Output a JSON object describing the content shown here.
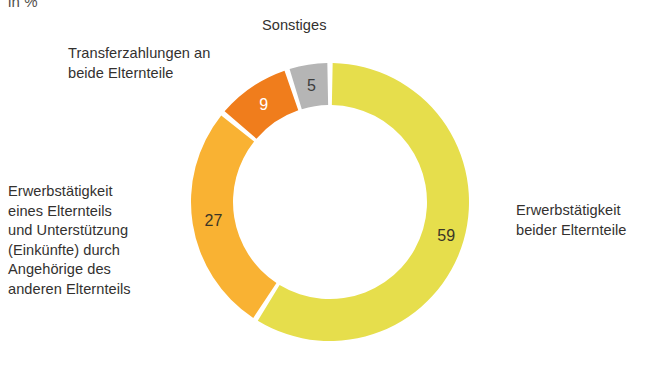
{
  "unit": {
    "text": "in %"
  },
  "labels": {
    "sonstiges": "Sonstiges",
    "transfer": "Transferzahlungen an\nbeide Elternteile",
    "erwerb_eines": "Erwerbstätigkeit\neines Elternteils\nund Unterstützung\n(Einkünfte) durch\nAngehörige des\nanderen Elternteils",
    "erwerb_beider": "Erwerbstätigkeit\nbeider Elternteile"
  },
  "values": {
    "erwerb_beider": "59",
    "erwerb_eines": "27",
    "transfer": "9",
    "sonstiges": "5"
  },
  "colors": {
    "erwerb_beider": "#e6de4c",
    "erwerb_eines": "#f9b233",
    "transfer": "#f07d1c",
    "sonstiges": "#b5b5b5",
    "separator": "#ffffff",
    "text": "#33312f"
  },
  "chart_data": {
    "type": "pie",
    "title": "",
    "subtitle": "in %",
    "xlabel": "",
    "ylabel": "",
    "unit": "%",
    "donut": true,
    "legend_position": "callout-labels",
    "grid": false,
    "start_angle_deg": 0,
    "direction": "clockwise",
    "categories": [
      "Erwerbstätigkeit beider Elternteile",
      "Erwerbstätigkeit eines Elternteils und Unterstützung (Einkünfte) durch Angehörige des anderen Elternteils",
      "Transferzahlungen an beide Elternteile",
      "Sonstiges"
    ],
    "values": [
      59,
      27,
      9,
      5
    ],
    "colors": [
      "#e6de4c",
      "#f9b233",
      "#f07d1c",
      "#b5b5b5"
    ],
    "data_labels": [
      "59",
      "27",
      "9",
      "5"
    ],
    "total": 100
  }
}
